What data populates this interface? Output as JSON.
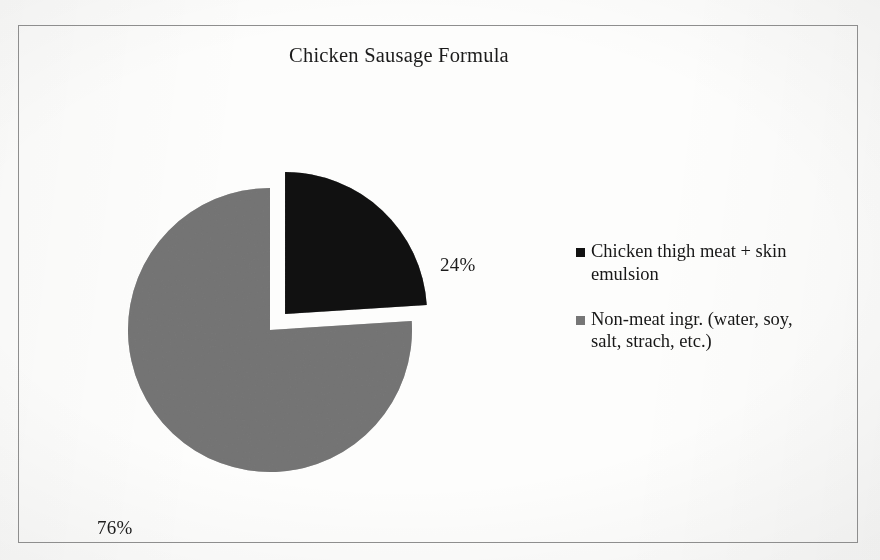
{
  "figure": {
    "title": "Chicken Sausage Formula",
    "frame_color": "#8e8e8e",
    "background_color": "#fdfdfc"
  },
  "chart_data": {
    "type": "pie",
    "title": "Chicken Sausage Formula",
    "xlabel": "",
    "ylabel": "",
    "categories": [
      "Chicken thigh meat + skin emulsion",
      "Non-meat ingr. (water, soy, salt, strach, etc.)"
    ],
    "values": [
      24,
      76
    ],
    "value_labels": [
      "24%",
      "76%"
    ],
    "units": "percent",
    "colors": [
      "#0d0d0d",
      "#757575"
    ],
    "start_angle_deg": 0,
    "direction": "clockwise",
    "exploded_slices": [
      0
    ],
    "explode_offset_px": 22,
    "legend_position": "right",
    "grid": false,
    "slices": [
      {
        "label": "Chicken thigh meat + skin emulsion",
        "value": 24,
        "display": "24%",
        "color": "#0d0d0d",
        "exploded": true,
        "start_deg": 0,
        "end_deg": 86.4
      },
      {
        "label": "Non-meat ingr. (water, soy, salt, strach, etc.)",
        "value": 76,
        "display": "76%",
        "color": "#757575",
        "exploded": false,
        "start_deg": 86.4,
        "end_deg": 360
      }
    ]
  },
  "labels": {
    "slice_0": "24%",
    "slice_1": "76%"
  },
  "legend": {
    "entries": [
      {
        "marker": "legend-swatch-black",
        "color": "#0d0d0d",
        "label": "Chicken thigh meat + skin emulsion"
      },
      {
        "marker": "legend-swatch-gray",
        "color": "#757575",
        "label": "Non-meat ingr. (water, soy, salt, strach, etc.)"
      }
    ]
  }
}
